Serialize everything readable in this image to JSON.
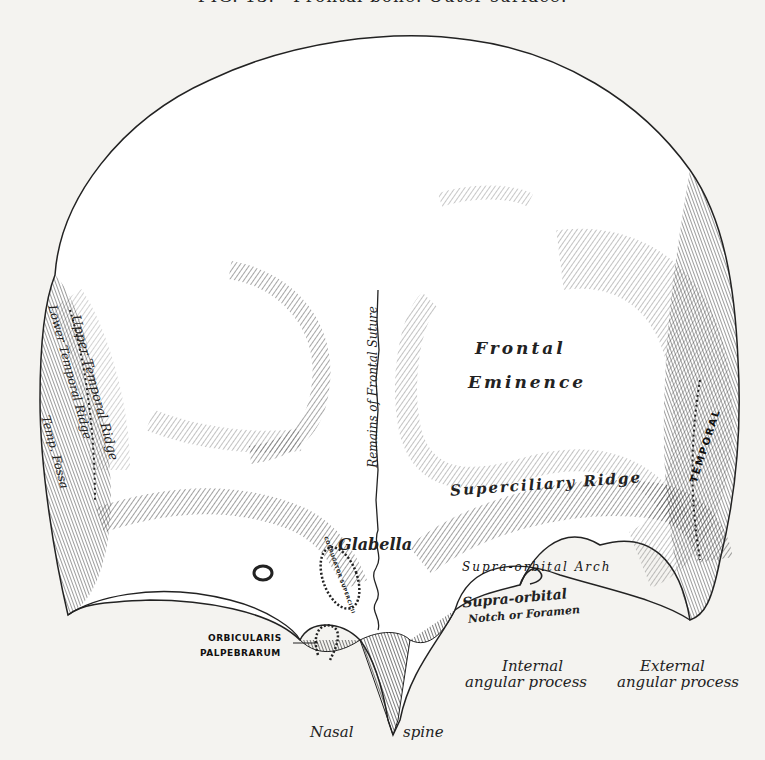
{
  "figure": {
    "title": "FIG. 13.—Frontal bone. Outer surface."
  },
  "labels": {
    "frontal": "Frontal",
    "eminence": "Eminence",
    "remains_suture": "Remains of Frontal Suture",
    "superciliary": "Superciliary Ridge",
    "glabella": "Glabella",
    "supra_orbital_arch": "Supra-orbital Arch",
    "supra_orbital_notch_1": "Supra-orbital",
    "supra_orbital_notch_2": "Notch or Foramen",
    "upper_temporal_ridge": "Upper Temporal Ridge",
    "lower_temporal_ridge": "Lower Temporal Ridge",
    "temp_fossa": "Temp. Fossa",
    "temporal": "TEMPORAL",
    "corrugator": "CORRUGATOR SUPERCILII",
    "orbicularis_1": "ORBICULARIS",
    "orbicularis_2": "PALPEBRARUM",
    "internal_1": "Internal",
    "internal_2": "angular process",
    "external_1": "External",
    "external_2": "angular process",
    "nasal": "Nasal",
    "spine": "spine"
  },
  "colors": {
    "paper": "#f4f3f0",
    "ink": "#222222",
    "bone": "#ffffff",
    "shade": "#8a8a8a",
    "dark_shade": "#555555"
  }
}
